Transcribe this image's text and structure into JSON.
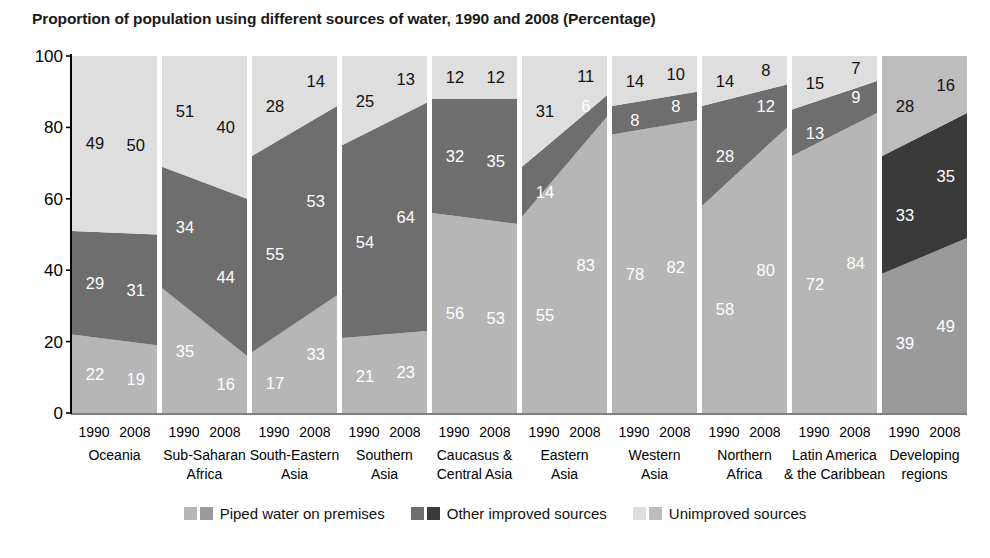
{
  "title": "Proportion of population using different sources of water, 1990 and 2008 (Percentage)",
  "axis": {
    "y_ticks": [
      "100",
      "80",
      "60",
      "40",
      "20",
      "0"
    ],
    "ylim": [
      0,
      100
    ],
    "years": [
      "1990",
      "2008"
    ]
  },
  "legend": {
    "items": [
      {
        "label": "Piped water on premises",
        "color_light": "#b6b6b6",
        "color_dark": "#9a9a9a"
      },
      {
        "label": "Other improved sources",
        "color_light": "#6e6e6e",
        "color_dark": "#3a3a3a"
      },
      {
        "label": "Unimproved sources",
        "color_light": "#dedede",
        "color_dark": "#bdbdbd"
      }
    ]
  },
  "colors": {
    "piped": "#b6b6b6",
    "other": "#6e6e6e",
    "unimproved": "#dedede",
    "piped_dev": "#9a9a9a",
    "other_dev": "#3a3a3a",
    "unimproved_dev": "#bdbdbd",
    "axis": "#000000",
    "title": "#1a1a1a"
  },
  "chart_data": {
    "type": "area",
    "title": "Proportion of population using different sources of water, 1990 and 2008 (Percentage)",
    "xlabel": "",
    "ylabel": "",
    "ylim": [
      0,
      100
    ],
    "grid": false,
    "legend_position": "bottom",
    "x": [
      "1990",
      "2008"
    ],
    "categories": [
      "Oceania",
      "Sub-Saharan Africa",
      "South-Eastern Asia",
      "Southern Asia",
      "Caucasus & Central Asia",
      "Eastern Asia",
      "Western Asia",
      "Northern Africa",
      "Latin America & the Caribbean",
      "Developing regions"
    ],
    "series": [
      {
        "name": "Piped water on premises",
        "values_1990": [
          22,
          35,
          17,
          21,
          56,
          55,
          78,
          58,
          72,
          39
        ],
        "values_2008": [
          19,
          16,
          33,
          23,
          53,
          83,
          82,
          80,
          84,
          49
        ]
      },
      {
        "name": "Other improved sources",
        "values_1990": [
          29,
          34,
          55,
          54,
          32,
          14,
          8,
          28,
          13,
          33
        ],
        "values_2008": [
          31,
          44,
          53,
          64,
          35,
          6,
          8,
          12,
          9,
          35
        ]
      },
      {
        "name": "Unimproved sources",
        "values_1990": [
          49,
          51,
          28,
          25,
          12,
          31,
          14,
          14,
          15,
          28
        ],
        "values_2008": [
          50,
          40,
          14,
          13,
          12,
          11,
          10,
          8,
          7,
          16
        ]
      }
    ],
    "groups": [
      {
        "region": "Oceania",
        "region_lines": [
          "Oceania",
          ""
        ],
        "highlight": false,
        "v1990": {
          "piped": 22,
          "other": 29,
          "unimproved": 49
        },
        "v2008": {
          "piped": 19,
          "other": 31,
          "unimproved": 50
        }
      },
      {
        "region": "Sub-Saharan Africa",
        "region_lines": [
          "Sub-Saharan",
          "Africa"
        ],
        "highlight": false,
        "v1990": {
          "piped": 35,
          "other": 34,
          "unimproved": 51
        },
        "v2008": {
          "piped": 16,
          "other": 44,
          "unimproved": 40
        }
      },
      {
        "region": "South-Eastern Asia",
        "region_lines": [
          "South-Eastern",
          "Asia"
        ],
        "highlight": false,
        "v1990": {
          "piped": 17,
          "other": 55,
          "unimproved": 28
        },
        "v2008": {
          "piped": 33,
          "other": 53,
          "unimproved": 14
        }
      },
      {
        "region": "Southern Asia",
        "region_lines": [
          "Southern",
          "Asia"
        ],
        "highlight": false,
        "v1990": {
          "piped": 21,
          "other": 54,
          "unimproved": 25
        },
        "v2008": {
          "piped": 23,
          "other": 64,
          "unimproved": 13
        }
      },
      {
        "region": "Caucasus & Central Asia",
        "region_lines": [
          "Caucasus &",
          "Central Asia"
        ],
        "highlight": false,
        "v1990": {
          "piped": 56,
          "other": 32,
          "unimproved": 12
        },
        "v2008": {
          "piped": 53,
          "other": 35,
          "unimproved": 12
        }
      },
      {
        "region": "Eastern Asia",
        "region_lines": [
          "Eastern",
          "Asia"
        ],
        "highlight": false,
        "v1990": {
          "piped": 55,
          "other": 14,
          "unimproved": 31
        },
        "v2008": {
          "piped": 83,
          "other": 6,
          "unimproved": 11
        }
      },
      {
        "region": "Western Asia",
        "region_lines": [
          "Western",
          "Asia"
        ],
        "highlight": false,
        "v1990": {
          "piped": 78,
          "other": 8,
          "unimproved": 14
        },
        "v2008": {
          "piped": 82,
          "other": 8,
          "unimproved": 10
        }
      },
      {
        "region": "Northern Africa",
        "region_lines": [
          "Northern",
          "Africa"
        ],
        "highlight": false,
        "v1990": {
          "piped": 58,
          "other": 28,
          "unimproved": 14
        },
        "v2008": {
          "piped": 80,
          "other": 12,
          "unimproved": 8
        }
      },
      {
        "region": "Latin America & the Caribbean",
        "region_lines": [
          "Latin America",
          "& the Caribbean"
        ],
        "highlight": false,
        "v1990": {
          "piped": 72,
          "other": 13,
          "unimproved": 15
        },
        "v2008": {
          "piped": 84,
          "other": 9,
          "unimproved": 7
        }
      },
      {
        "region": "Developing regions",
        "region_lines": [
          "Developing",
          "regions"
        ],
        "highlight": true,
        "v1990": {
          "piped": 39,
          "other": 33,
          "unimproved": 28
        },
        "v2008": {
          "piped": 49,
          "other": 35,
          "unimproved": 16
        }
      }
    ]
  }
}
